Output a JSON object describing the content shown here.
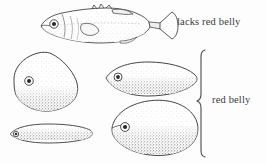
{
  "figure": {
    "kind": "scientific-illustration",
    "background_color": "#fdfdfd",
    "ink_color": "#3a3a3a",
    "width": 266,
    "height": 164
  },
  "labels": {
    "top": "lacks red belly",
    "bracketed": "red belly"
  },
  "bracket": {
    "name": "curly-brace",
    "orientation": "left-pointing",
    "top_y": 50,
    "bottom_y": 157,
    "tip_y": 100
  },
  "specimens": [
    {
      "id": "lateral-whole-fish",
      "name": "stickleback-lateral-view",
      "shape": "full-bodied fish with caudal fin and dorsal spines",
      "group": "lacks red belly",
      "shaded_belly": false,
      "eye": true
    },
    {
      "id": "deep-diamond-body",
      "name": "deep-bodied-rhomboid-outline",
      "shape": "rounded diamond / rhombus",
      "group": "red belly",
      "shaded_belly": true,
      "eye": true
    },
    {
      "id": "slender-spindle-body",
      "name": "very-slender-spindle-outline",
      "shape": "extremely elongate lens",
      "group": "red belly",
      "shaded_belly": true,
      "eye": true
    },
    {
      "id": "medium-ellipse-body",
      "name": "elongate-ellipse-outline",
      "shape": "elongate pointed ellipse",
      "group": "red belly",
      "shaded_belly": true,
      "eye": true
    },
    {
      "id": "broad-lens-body",
      "name": "broad-lens-outline",
      "shape": "large lemon / lens shape",
      "group": "red belly",
      "shaded_belly": true,
      "eye": true
    }
  ]
}
